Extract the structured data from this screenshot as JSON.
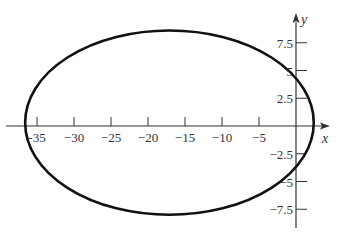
{
  "chart_data": {
    "type": "line",
    "title": "",
    "subtitle": "",
    "xlabel": "x",
    "ylabel": "y",
    "xlim": [
      -37.5,
      4.5
    ],
    "ylim": [
      -10,
      10
    ],
    "grid": false,
    "legend": null,
    "x_ticks": [
      -35,
      -30,
      -25,
      -20,
      -15,
      -10,
      -5
    ],
    "x_tick_labels": [
      "-35",
      "−30",
      "−25",
      "−20",
      "−15",
      "−10",
      "−5"
    ],
    "y_ticks": [
      7.5,
      5,
      2.5,
      -2.5,
      -5,
      -7.5
    ],
    "y_tick_labels": [
      "7.5",
      "5",
      "2.5",
      "−2.5",
      "−5",
      "−7.5"
    ],
    "series": [
      {
        "name": "ellipse",
        "shape": "ellipse",
        "center": [
          -17.1,
          0.3
        ],
        "semi_axis_x": 19.5,
        "semi_axis_y": 8.3,
        "x_min": -36.6,
        "x_max": 2.4,
        "y_min": -8.0,
        "y_max": 8.6,
        "color": "#111111"
      }
    ]
  },
  "colors": {
    "curve": "#111111",
    "axis": "#333333",
    "background": "#ffffff"
  }
}
